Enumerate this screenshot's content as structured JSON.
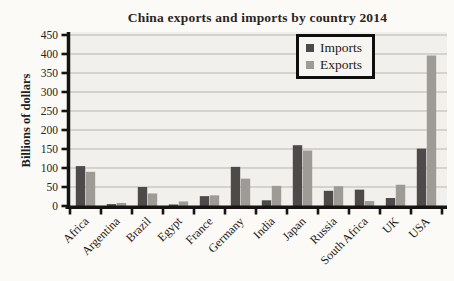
{
  "chart_data": {
    "type": "bar",
    "title": "China exports and imports by country 2014",
    "xlabel": "",
    "ylabel": "Billions of dollars",
    "categories": [
      "Africa",
      "Argentina",
      "Brazil",
      "Egypt",
      "France",
      "Germany",
      "India",
      "Japan",
      "Russia",
      "South Africa",
      "UK",
      "USA"
    ],
    "series": [
      {
        "name": "Imports",
        "color": "#4e4a4a",
        "values": [
          105,
          5,
          50,
          4,
          26,
          103,
          15,
          160,
          40,
          43,
          21,
          151
        ]
      },
      {
        "name": "Exports",
        "color": "#9e9b97",
        "values": [
          90,
          8,
          33,
          12,
          28,
          72,
          53,
          146,
          52,
          13,
          56,
          396
        ]
      }
    ],
    "ylim": [
      0,
      450
    ],
    "yticks": [
      0,
      50,
      100,
      150,
      200,
      250,
      300,
      350,
      400,
      450
    ],
    "grid": "horizontal",
    "legend_position": "top-right",
    "colors": {
      "axis": "#161412",
      "gridline": "#b8b5b0",
      "plot_background": "#f1f0ec",
      "tick_label": "#262320",
      "title_text": "#2b2522"
    }
  }
}
